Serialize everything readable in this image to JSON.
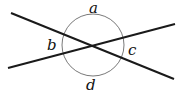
{
  "diagram": {
    "type": "intersecting-lines-with-angle-circle",
    "labels": {
      "a": "a",
      "b": "b",
      "c": "c",
      "d": "d"
    },
    "colors": {
      "line": "#1a1a1a",
      "circle": "#666666",
      "background": "#ffffff"
    }
  }
}
